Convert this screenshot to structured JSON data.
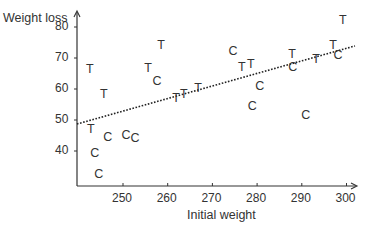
{
  "chart_data": {
    "type": "scatter",
    "title": "",
    "xlabel": "Initial weight",
    "ylabel": "Weight loss",
    "xlim": [
      239.7,
      302
    ],
    "ylim": [
      29.5,
      84
    ],
    "xticks": [
      250,
      260,
      270,
      280,
      290,
      300
    ],
    "yticks": [
      40,
      50,
      60,
      70,
      80
    ],
    "grid": false,
    "legend": null,
    "marker_style": "letters",
    "series": [
      {
        "name": "T",
        "marker": "T",
        "points": [
          {
            "x": 242.6,
            "y": 66.5
          },
          {
            "x": 245.7,
            "y": 58.4
          },
          {
            "x": 242.8,
            "y": 47.1
          },
          {
            "x": 255.6,
            "y": 66.8
          },
          {
            "x": 258.5,
            "y": 74.2
          },
          {
            "x": 261.9,
            "y": 57.4
          },
          {
            "x": 263.6,
            "y": 58.4
          },
          {
            "x": 266.8,
            "y": 60.6
          },
          {
            "x": 276.6,
            "y": 67.1
          },
          {
            "x": 278.6,
            "y": 68.1
          },
          {
            "x": 287.8,
            "y": 71.6
          },
          {
            "x": 293.2,
            "y": 70.0
          },
          {
            "x": 297.0,
            "y": 74.5
          },
          {
            "x": 299.2,
            "y": 82.3
          }
        ]
      },
      {
        "name": "C",
        "marker": "C",
        "points": [
          {
            "x": 243.7,
            "y": 39.4
          },
          {
            "x": 244.6,
            "y": 32.6
          },
          {
            "x": 246.6,
            "y": 44.8
          },
          {
            "x": 250.7,
            "y": 45.2
          },
          {
            "x": 252.7,
            "y": 44.2
          },
          {
            "x": 257.6,
            "y": 62.9
          },
          {
            "x": 274.6,
            "y": 72.3
          },
          {
            "x": 280.6,
            "y": 61.0
          },
          {
            "x": 278.9,
            "y": 54.8
          },
          {
            "x": 288.0,
            "y": 67.4
          },
          {
            "x": 290.9,
            "y": 51.9
          },
          {
            "x": 298.1,
            "y": 71.0
          }
        ]
      }
    ],
    "annotations": [
      {
        "type": "line",
        "style": "dotted",
        "label": "regression line",
        "from": {
          "x": 239.7,
          "y": 48.7
        },
        "to": {
          "x": 301.9,
          "y": 73.9
        }
      }
    ]
  },
  "axes": {
    "xlabel": "Initial weight",
    "ylabel": "Weight loss",
    "xtick_labels": [
      "250",
      "260",
      "270",
      "280",
      "290",
      "300"
    ],
    "ytick_labels": [
      "40",
      "50",
      "60",
      "70",
      "80"
    ]
  },
  "colors": {
    "axis": "#333333",
    "text": "#333333",
    "line": "#222222"
  }
}
